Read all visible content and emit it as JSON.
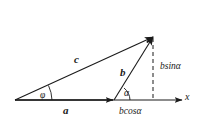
{
  "figure": {
    "background_color": "#ffffff",
    "stroke_color": "#1a1a1a",
    "labels": {
      "vector_c": "c",
      "vector_b": "b",
      "vector_a": "a",
      "angle_phi": "φ",
      "angle_alpha": "α",
      "component_vertical": "bsinα",
      "component_horizontal": "bcosα",
      "axis_x": "x"
    },
    "geometry": {
      "origin": {
        "x": 15,
        "y": 100
      },
      "axis_end": {
        "x": 182,
        "y": 100
      },
      "vector_a_tip": {
        "x": 113,
        "y": 100
      },
      "resultant_tip": {
        "x": 153,
        "y": 37
      },
      "dashed_foot": {
        "x": 153,
        "y": 100
      }
    },
    "icons": {
      "arrowhead": "arrowhead-icon",
      "dashed_line": "dashed-line-icon",
      "angle_arc": "angle-arc-icon"
    }
  }
}
